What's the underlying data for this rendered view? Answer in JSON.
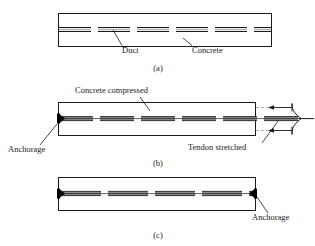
{
  "figure": {
    "colors": {
      "outline": "#1a1a1a",
      "tendon_fill": "#8c8c8c",
      "tendon_edge": "#1a1a1a",
      "anchorage": "#000000",
      "background": "#ffffff"
    }
  },
  "panels": [
    {
      "id": "a",
      "caption": "(a)",
      "labels": [
        {
          "name": "duct",
          "text": "Duct"
        },
        {
          "name": "concrete",
          "text": "Concrete"
        }
      ]
    },
    {
      "id": "b",
      "caption": "(b)",
      "labels": [
        {
          "name": "concrete-compressed",
          "text": "Concrete compressed"
        },
        {
          "name": "anchorage",
          "text": "Anchorage"
        },
        {
          "name": "tendon-stretched",
          "text": "Tendon stretched"
        }
      ]
    },
    {
      "id": "c",
      "caption": "(c)",
      "labels": [
        {
          "name": "anchorage",
          "text": "Anchorage"
        }
      ]
    }
  ],
  "icons": {
    "anchorage_marker": "anchorage-wedge-icon",
    "jack_bracket": "jack-bracket-icon",
    "force_arrow": "force-arrow-icon",
    "leader_line": "leader-line-icon"
  }
}
